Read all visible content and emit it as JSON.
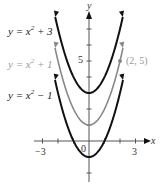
{
  "chart_data": {
    "type": "line",
    "title": "",
    "xlabel": "x",
    "ylabel": "y",
    "xlim": [
      -3.5,
      3.8
    ],
    "ylim": [
      -2.3,
      7.8
    ],
    "x_ticks": [
      -3,
      -2,
      -1,
      1,
      2,
      3
    ],
    "x_tick_labels": [
      "-3",
      "3"
    ],
    "y_ticks": [
      -2,
      -1,
      1,
      2,
      3,
      4,
      5,
      6,
      7
    ],
    "y_tick_labels": [
      "5"
    ],
    "origin_label": "0",
    "series": [
      {
        "name": "y = x^2 + 3",
        "formula": "x^2+3",
        "color": "#111111",
        "width": 2
      },
      {
        "name": "y = x^2 + 1",
        "formula": "x^2+1",
        "color": "#888888",
        "width": 1.6
      },
      {
        "name": "y = x^2 - 1",
        "formula": "x^2-1",
        "color": "#111111",
        "width": 2
      }
    ],
    "annotations": [
      {
        "point": [
          2,
          5
        ],
        "label": "(2, 5)",
        "series": "y = x^2 + 1"
      }
    ],
    "grid": false
  },
  "labels": {
    "curve1": {
      "pre": "y = x",
      "exp": "2",
      "post": " + 3"
    },
    "curve2": {
      "pre": "y = x",
      "exp": "2",
      "post": " + 1"
    },
    "curve3": {
      "pre": "y = x",
      "exp": "2",
      "post": " − 1"
    },
    "point": "(2, 5)",
    "x_axis": "x",
    "y_axis": "y",
    "tick_neg3": "−3",
    "tick_3": "3",
    "tick_5": "5",
    "origin": "0"
  }
}
